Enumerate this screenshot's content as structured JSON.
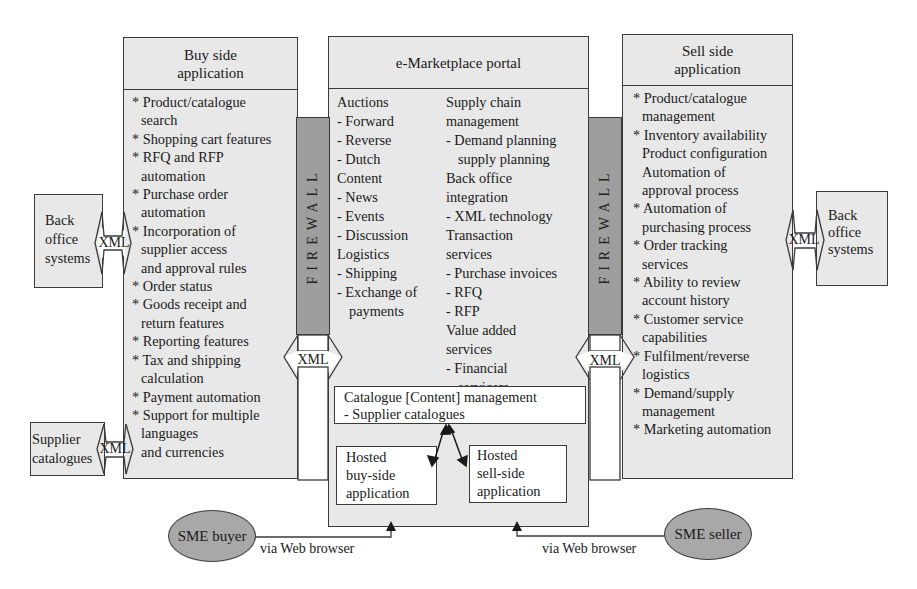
{
  "buy_side": {
    "title_line1": "Buy side",
    "title_line2": "application",
    "items": [
      [
        "* Product/catalogue",
        "search"
      ],
      [
        "* Shopping cart features"
      ],
      [
        "* RFQ and RFP",
        "automation"
      ],
      [
        "* Purchase order",
        "automation"
      ],
      [
        "* Incorporation of",
        "supplier access",
        "and approval rules"
      ],
      [
        "* Order status"
      ],
      [
        "* Goods receipt and",
        "return features"
      ],
      [
        "* Reporting features"
      ],
      [
        "* Tax and shipping",
        "calculation"
      ],
      [
        "* Payment automation"
      ],
      [
        "* Support for multiple",
        "languages",
        "and currencies"
      ]
    ]
  },
  "portal": {
    "title": "e-Marketplace portal",
    "left_column": [
      {
        "text": "Auctions",
        "indent": 0
      },
      {
        "text": "- Forward",
        "indent": 0
      },
      {
        "text": "- Reverse",
        "indent": 0
      },
      {
        "text": "- Dutch",
        "indent": 0
      },
      {
        "text": "Content",
        "indent": 0
      },
      {
        "text": "- News",
        "indent": 0
      },
      {
        "text": "- Events",
        "indent": 0
      },
      {
        "text": "- Discussion",
        "indent": 0
      },
      {
        "text": "Logistics",
        "indent": 0
      },
      {
        "text": "- Shipping",
        "indent": 0
      },
      {
        "text": "- Exchange of",
        "indent": 0
      },
      {
        "text": "payments",
        "indent": 1
      }
    ],
    "right_column": [
      {
        "text": "Supply chain",
        "indent": 0
      },
      {
        "text": "management",
        "indent": 0
      },
      {
        "text": "- Demand planning",
        "indent": 0
      },
      {
        "text": "supply planning",
        "indent": 1
      },
      {
        "text": "Back office",
        "indent": 0
      },
      {
        "text": "integration",
        "indent": 0
      },
      {
        "text": "- XML technology",
        "indent": 0
      },
      {
        "text": "Transaction",
        "indent": 0
      },
      {
        "text": "services",
        "indent": 0
      },
      {
        "text": "- Purchase invoices",
        "indent": 0
      },
      {
        "text": "- RFQ",
        "indent": 0
      },
      {
        "text": "- RFP",
        "indent": 0
      },
      {
        "text": "Value added",
        "indent": 0
      },
      {
        "text": "services",
        "indent": 0
      },
      {
        "text": "- Financial",
        "indent": 0
      },
      {
        "text": "servicers",
        "indent": 1
      }
    ],
    "catalogue_box": {
      "line1": "Catalogue [Content] management",
      "line2": "- Supplier catalogues"
    },
    "hosted_buy": {
      "line1": "Hosted",
      "line2": "buy-side",
      "line3": "application"
    },
    "hosted_sell": {
      "line1": "Hosted",
      "line2": "sell-side",
      "line3": "application"
    }
  },
  "sell_side": {
    "title_line1": "Sell side",
    "title_line2": "application",
    "items": [
      [
        "* Product/catalogue",
        "management"
      ],
      [
        "* Inventory availability",
        "Product configuration",
        "Automation of",
        "approval process"
      ],
      [
        "* Automation of",
        "purchasing process"
      ],
      [
        "* Order tracking",
        "services"
      ],
      [
        "* Ability to review",
        "account history"
      ],
      [
        "* Customer service",
        "capabilities"
      ],
      [
        "* Fulfilment/reverse",
        "logistics"
      ],
      [
        "* Demand/supply",
        "management"
      ],
      [
        "* Marketing automation"
      ]
    ]
  },
  "firewall": {
    "label": "FIREWALL"
  },
  "xml": {
    "label": "XML"
  },
  "back_office_left": {
    "line1": "Back",
    "line2": "office",
    "line3": "systems"
  },
  "back_office_right": {
    "line1": "Back",
    "line2": "office",
    "line3": "systems"
  },
  "supplier_catalogues": {
    "line1": "Supplier",
    "line2": "catalogues"
  },
  "sme_buyer": {
    "label": "SME buyer",
    "caption": "via Web browser"
  },
  "sme_seller": {
    "label": "SME seller",
    "caption": "via Web browser"
  },
  "colors": {
    "box_fill": "#e8e8e8",
    "firewall_fill": "#9e9e9e",
    "ellipse_fill": "#a8a8a8",
    "border": "#3a3a3a"
  }
}
